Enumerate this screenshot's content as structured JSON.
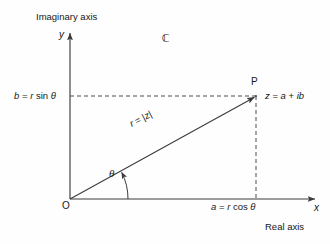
{
  "figure": {
    "background_color": "#fefefe",
    "stroke_color": "#3a3a3a",
    "text_color": "#171717"
  },
  "axes": {
    "imaginary_axis_label": "Imaginary axis",
    "real_axis_label": "Real axis",
    "y_symbol": "y",
    "x_symbol": "x",
    "origin_symbol": "O"
  },
  "plane": {
    "set_symbol": "ℂ"
  },
  "point": {
    "name": "P",
    "value_expression_parts": {
      "z": "z",
      "equals": " = ",
      "a": "a",
      "plus": " + ",
      "i": "i",
      "b": "b"
    },
    "value_expression": "z = a + ib"
  },
  "components": {
    "imaginary_parts": {
      "b": "b",
      "equals": " = ",
      "r": "r",
      "space": " ",
      "sin": "sin",
      "theta": " θ"
    },
    "imaginary_expression": "b = r sin θ",
    "real_parts": {
      "a": "a",
      "equals": " = ",
      "r": "r",
      "space": " ",
      "cos": "cos",
      "theta": " θ"
    },
    "real_expression": "a = r cos θ"
  },
  "modulus": {
    "parts": {
      "r": "r",
      "equals": " = ",
      "bar_open": "|",
      "z": "z",
      "bar_close": "|"
    },
    "expression": "r = |z|"
  },
  "angle": {
    "symbol": "θ"
  },
  "geometry": {
    "origin": {
      "x": 70,
      "y": 199
    },
    "point_p": {
      "x": 256,
      "y": 96
    },
    "x_axis_end": {
      "x": 317,
      "y": 199
    },
    "y_axis_top": {
      "x": 70,
      "y": 31
    },
    "arc_radius": 58
  }
}
